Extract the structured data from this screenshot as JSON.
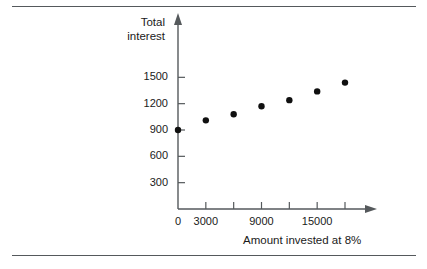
{
  "chart_data": {
    "type": "scatter",
    "title": "",
    "xlabel": "Amount invested at 8%",
    "ylabel": "Total interest",
    "ylabel_lines": [
      "Total",
      "interest"
    ],
    "x": [
      0,
      3000,
      6000,
      9000,
      12000,
      15000,
      18000
    ],
    "values": [
      900,
      1010,
      1080,
      1170,
      1240,
      1340,
      1440
    ],
    "points": [
      {
        "x": 0,
        "y": 900
      },
      {
        "x": 3000,
        "y": 1010
      },
      {
        "x": 6000,
        "y": 1080
      },
      {
        "x": 9000,
        "y": 1170
      },
      {
        "x": 12000,
        "y": 1240
      },
      {
        "x": 15000,
        "y": 1340
      },
      {
        "x": 18000,
        "y": 1440
      }
    ],
    "xlim": [
      0,
      21000
    ],
    "ylim": [
      0,
      1650
    ],
    "xticks": [
      0,
      3000,
      6000,
      9000,
      12000,
      15000,
      18000
    ],
    "xtick_labels": [
      "0",
      "3000",
      "",
      "9000",
      "",
      "15000",
      ""
    ],
    "yticks": [
      300,
      600,
      900,
      1200,
      1500
    ],
    "ytick_labels": [
      "300",
      "600",
      "900",
      "1200",
      "1500"
    ],
    "grid": false,
    "legend": false,
    "marker": "filled-circle",
    "marker_color": "#101010",
    "axis_color": "#55595c",
    "axis_arrows": [
      "x-right",
      "y-up"
    ]
  },
  "figure": {
    "rule_top_label": "top-divider-rule",
    "rule_bottom_label": "bottom-divider-rule",
    "background_color": "#ffffff"
  }
}
